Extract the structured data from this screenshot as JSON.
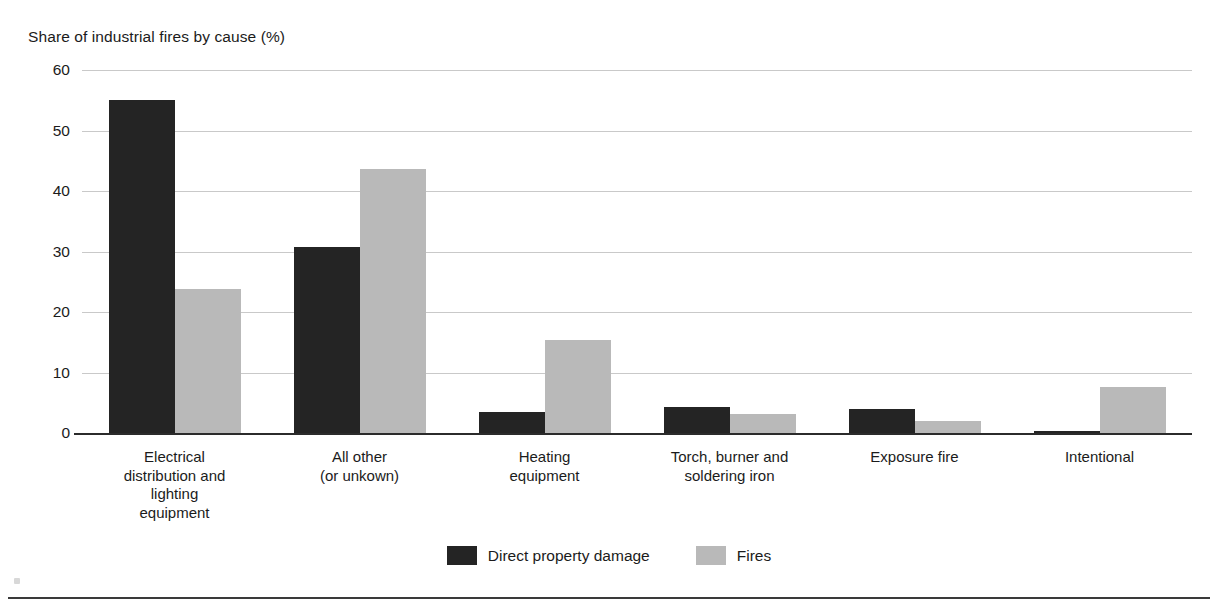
{
  "chart_data": {
    "type": "bar",
    "title": "",
    "ylabel": "Share of industrial fires by cause (%)",
    "xlabel": "",
    "ylim": [
      0,
      60
    ],
    "yticks": [
      0,
      10,
      20,
      30,
      40,
      50,
      60
    ],
    "ytick_labels": [
      "0",
      "10",
      "20",
      "30",
      "40",
      "50",
      "60"
    ],
    "grid": true,
    "legend_position": "bottom-center",
    "orientation": "vertical",
    "grouping": "grouped",
    "categories": [
      "Electrical distribution and lighting equipment",
      "All other (or unkown)",
      "Heating equipment",
      "Torch, burner and soldering iron",
      "Exposure fire",
      "Intentional"
    ],
    "category_label_lines": [
      [
        "Electrical",
        "distribution and",
        "lighting",
        "equipment"
      ],
      [
        "All other",
        "(or unkown)"
      ],
      [
        "Heating",
        "equipment"
      ],
      [
        "Torch, burner and",
        "soldering iron"
      ],
      [
        "Exposure fire"
      ],
      [
        "Intentional"
      ]
    ],
    "series": [
      {
        "name": "Direct property damage",
        "color": "#242424",
        "values": [
          55.0,
          30.8,
          3.5,
          4.3,
          3.9,
          0.4
        ]
      },
      {
        "name": "Fires",
        "color": "#b9b9b9",
        "values": [
          23.8,
          43.7,
          15.4,
          3.1,
          2.0,
          7.6
        ]
      }
    ]
  },
  "legend": {
    "items": [
      {
        "label": "Direct property damage",
        "series": 0
      },
      {
        "label": "Fires",
        "series": 1
      }
    ]
  },
  "footer": {
    "text": ""
  },
  "colors": {
    "series_dark": "#242424",
    "series_light": "#b9b9b9",
    "gridline": "#c9c9c9",
    "axis": "#2b2b2b",
    "text": "#1b1b1b",
    "background": "#ffffff"
  }
}
